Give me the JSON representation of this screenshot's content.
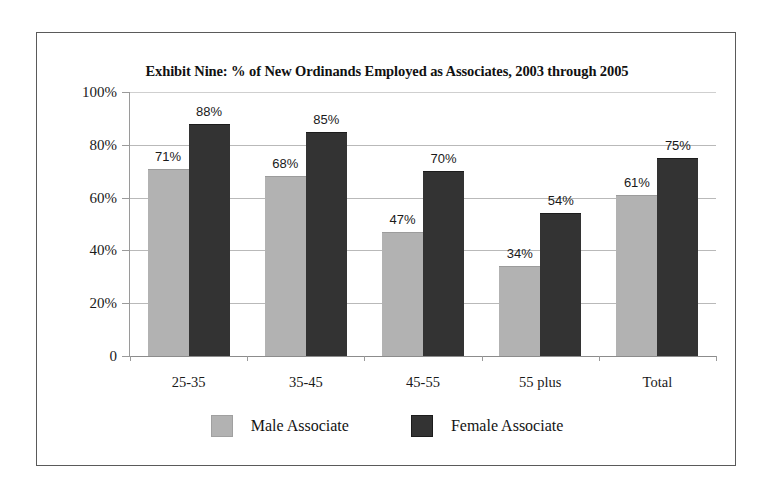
{
  "chart_data": {
    "type": "bar",
    "title": "Exhibit Nine: % of New Ordinands Employed as Associates, 2003 through 2005",
    "xlabel": "",
    "ylabel": "",
    "ylim": [
      0,
      100
    ],
    "yticks": [
      "0",
      "20%",
      "40%",
      "60%",
      "80%",
      "100%"
    ],
    "ytick_values": [
      0,
      20,
      40,
      60,
      80,
      100
    ],
    "grid": true,
    "legend_position": "bottom",
    "categories": [
      "25-35",
      "35-45",
      "45-55",
      "55 plus",
      "Total"
    ],
    "series": [
      {
        "name": "Male Associate",
        "color": "#b2b2b2",
        "values": [
          71,
          68,
          47,
          34,
          61
        ],
        "labels": [
          "71%",
          "68%",
          "47%",
          "34%",
          "61%"
        ]
      },
      {
        "name": "Female Associate",
        "color": "#333333",
        "values": [
          88,
          85,
          70,
          54,
          75
        ],
        "labels": [
          "88%",
          "85%",
          "70%",
          "54%",
          "75%"
        ]
      }
    ]
  }
}
